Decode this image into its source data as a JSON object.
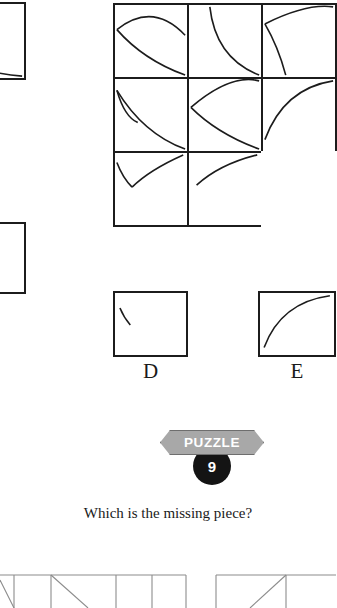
{
  "page": {
    "background_color": "#ffffff",
    "line_color": "#1c1c1c",
    "curve_color": "#1c1c1c"
  },
  "badge": {
    "banner_label": "PUZZLE",
    "number": "9",
    "banner_color": "#a8a8a8",
    "banner_border_color": "#6e6e6e",
    "banner_text_color": "#ffffff",
    "disc_color": "#141414",
    "disc_text_color": "#ffffff"
  },
  "question": {
    "text": "Which is the missing piece?"
  },
  "matrix": {
    "rows": 3,
    "columns": 3,
    "missing_cell": "row3-col3",
    "cells": [
      {
        "id": "row1-col1",
        "content": "lens-two-arcs",
        "description": "two arcs bowing apart forming a leaf/lens shape"
      },
      {
        "id": "row1-col2",
        "content": "single-arc-tl-br",
        "description": "single arc sweeping from top-left down to bottom-right"
      },
      {
        "id": "row1-col3",
        "content": "arc-with-tail",
        "description": "arc from top edge to right edge with short tail at left"
      },
      {
        "id": "row2-col1",
        "content": "arc-with-tail",
        "description": "arc from left edge down to bottom-right with short tail"
      },
      {
        "id": "row2-col2",
        "content": "lens-two-arcs",
        "description": "two arcs bowing apart forming a leaf/lens shape"
      },
      {
        "id": "row2-col3",
        "content": "single-arc-bl-tr",
        "description": "single arc sweeping from bottom-left up to top-right"
      },
      {
        "id": "row3-col1",
        "content": "v-two-arcs",
        "description": "two short arcs meeting at a point forming a V"
      },
      {
        "id": "row3-col2",
        "content": "short-arc-bl-tr",
        "description": "short arc rising from lower-left to top-right"
      },
      {
        "id": "row3-col3",
        "content": "empty",
        "description": "blank cell - the missing piece"
      }
    ]
  },
  "options": [
    {
      "id": "option-partial-top",
      "label": "",
      "content": "partial-arc-bottom-left",
      "visible": "clipped-left-edge"
    },
    {
      "id": "option-partial-bottom",
      "label": "",
      "content": "empty",
      "visible": "clipped-left-edge"
    },
    {
      "id": "option-d",
      "label": "D",
      "content": "short-stroke-upper-left"
    },
    {
      "id": "option-e",
      "label": "E",
      "content": "single-arc-bl-tr"
    }
  ],
  "next_puzzle_strip": {
    "description": "top edge of the following puzzle grid with thin gray cell borders and diagonals",
    "line_color": "#8c8c8c"
  }
}
